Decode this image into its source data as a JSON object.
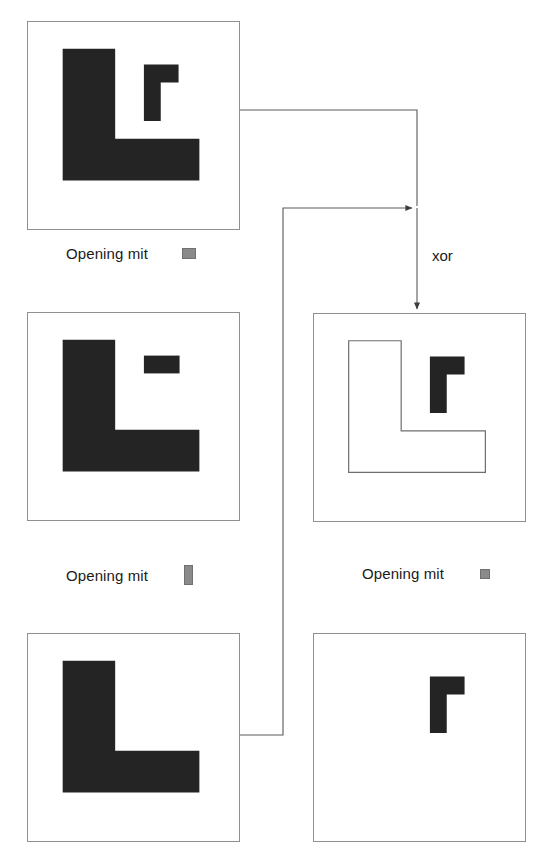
{
  "diagram": {
    "background_color": "#ffffff",
    "shape_fill_color": "#242424",
    "outline_color": "#6e6e6e",
    "panel_border_color": "#8f8f8f",
    "structuring_element_color": "#8a8a8a",
    "connector_color": "#5a5a5a",
    "operator_label": "xor"
  },
  "panels": [
    {
      "id": "source-image",
      "role": "input",
      "x": 27,
      "y": 21,
      "w": 213,
      "h": 209,
      "shapes": [
        {
          "name": "large-l-shape",
          "style": "filled",
          "kind": "L"
        },
        {
          "name": "small-gamma-shape",
          "style": "filled",
          "kind": "gamma"
        }
      ]
    },
    {
      "id": "opening-horizontal-result",
      "role": "intermediate",
      "x": 27,
      "y": 312,
      "w": 213,
      "h": 209,
      "shapes": [
        {
          "name": "large-l-shape",
          "style": "filled",
          "kind": "L"
        },
        {
          "name": "horizontal-bar-shape",
          "style": "filled",
          "kind": "bar-h"
        }
      ]
    },
    {
      "id": "opening-vertical-result",
      "role": "intermediate",
      "x": 27,
      "y": 633,
      "w": 213,
      "h": 209,
      "shapes": [
        {
          "name": "large-l-shape",
          "style": "filled",
          "kind": "L"
        }
      ]
    },
    {
      "id": "xor-result",
      "role": "output",
      "x": 313,
      "y": 313,
      "w": 213,
      "h": 209,
      "shapes": [
        {
          "name": "large-l-shape",
          "style": "outline",
          "kind": "L"
        },
        {
          "name": "small-gamma-shape",
          "style": "filled",
          "kind": "gamma"
        }
      ]
    },
    {
      "id": "opening-small-result",
      "role": "intermediate",
      "x": 313,
      "y": 633,
      "w": 213,
      "h": 209,
      "shapes": [
        {
          "name": "small-gamma-shape",
          "style": "filled",
          "kind": "gamma"
        }
      ]
    }
  ],
  "captions": [
    {
      "id": "caption-top-left",
      "text": "Opening mit",
      "element": "horizontal-structuring-element",
      "element_shape": "se-h",
      "x": 66,
      "y": 245
    },
    {
      "id": "caption-middle-left",
      "text": "Opening mit",
      "element": "vertical-structuring-element",
      "element_shape": "se-v",
      "x": 66,
      "y": 565
    },
    {
      "id": "caption-middle-right",
      "text": "Opening mit",
      "element": "square-structuring-element",
      "element_shape": "se-s",
      "x": 362,
      "y": 565
    }
  ],
  "operator": {
    "label": "xor",
    "x": 432,
    "y": 247
  },
  "connectors": [
    {
      "id": "source-to-xor",
      "from": "source-image",
      "to": "xor-result",
      "kind": "arrow",
      "path": "M 240 110 L 417 110 L 417 208"
    },
    {
      "id": "opening-small-to-xor",
      "from": "opening-small-result",
      "to": "xor-result",
      "kind": "arrow",
      "path": "M 240 735 L 283 735 L 283 208 L 417 208"
    },
    {
      "id": "xor-down-into-result",
      "from": "xor-junction",
      "to": "xor-result",
      "kind": "arrow",
      "path": "M 417 208 L 417 311"
    }
  ]
}
